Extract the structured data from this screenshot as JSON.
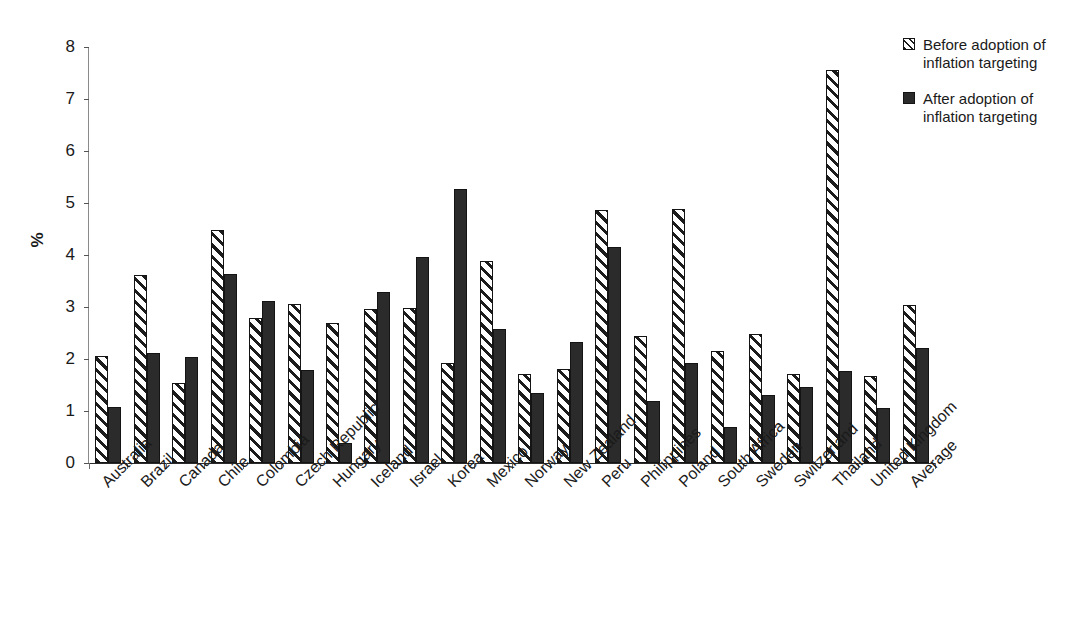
{
  "chart_data": {
    "type": "bar",
    "title": "",
    "xlabel": "",
    "ylabel": "%",
    "ylim": [
      0,
      8
    ],
    "ytick_values": [
      0,
      1,
      2,
      3,
      4,
      5,
      6,
      7,
      8
    ],
    "ytick_labels": [
      "0",
      "1",
      "2",
      "3",
      "4",
      "5",
      "6",
      "7",
      "8"
    ],
    "grid": false,
    "legend_position": "top-right",
    "categories": [
      "Australia",
      "Brazil",
      "Canada",
      "Chile",
      "Colombia",
      "Czech Republic",
      "Hungary",
      "Iceland",
      "Israel",
      "Korea",
      "Mexico",
      "Norway",
      "New Zealand",
      "Peru",
      "Philippines",
      "Poland",
      "South Africa",
      "Sweden",
      "Switzerland",
      "Thailand",
      "United Kingdom",
      "Average"
    ],
    "series": [
      {
        "name": "Before adoption of inflation targeting",
        "pattern": "diagonal-hatch",
        "color": "#ffffff",
        "values": [
          2.05,
          3.61,
          1.53,
          4.48,
          2.78,
          3.06,
          2.7,
          2.97,
          2.99,
          1.93,
          3.89,
          1.72,
          1.8,
          4.86,
          2.45,
          4.89,
          2.15,
          2.49,
          1.71,
          7.56,
          1.67,
          3.03
        ]
      },
      {
        "name": "After adoption of inflation targeting",
        "pattern": "solid",
        "color": "#2b2b2b",
        "values": [
          1.07,
          2.12,
          2.04,
          3.63,
          3.12,
          1.79,
          0.39,
          3.29,
          3.96,
          5.27,
          2.58,
          1.35,
          2.33,
          4.15,
          1.19,
          1.93,
          0.7,
          1.3,
          1.46,
          1.76,
          1.05,
          2.21
        ]
      }
    ]
  },
  "legend": {
    "entries": [
      {
        "label": "Before adoption of inflation targeting",
        "line1": "Before adoption of",
        "line2": "inflation targeting",
        "swatch": "hatched-swatch-icon"
      },
      {
        "label": "After adoption of inflation targeting",
        "line1": "After adoption of",
        "line2": "inflation targeting",
        "swatch": "solid-swatch-icon"
      }
    ]
  },
  "axis": {
    "y_title": "%"
  }
}
